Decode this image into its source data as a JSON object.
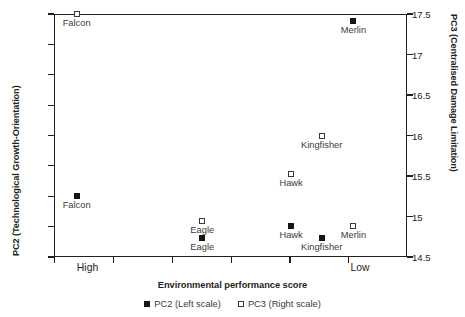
{
  "chart_data": {
    "type": "scatter",
    "title": "",
    "xlabel": "Environmental performance score",
    "ylabel": "PC2 (Technological Growth-Orientation)",
    "y2label": "PC3 (Centralised Damage Limitation)",
    "grid": false,
    "legend_position": "bottom-center",
    "xlim": [
      0,
      6
    ],
    "x_tick_count": 6,
    "x_category_labels": [
      "High",
      "Low"
    ],
    "x_category_positions": [
      0.57,
      5.2
    ],
    "ylim": [
      6.5,
      10.5
    ],
    "y_ticks": [
      "10.5",
      "10.0",
      "9.5",
      "9.0",
      "8.5",
      "8.0",
      "7.5",
      "7.0",
      "6.5"
    ],
    "y_tick_values": [
      10.5,
      10.0,
      9.5,
      9.0,
      8.5,
      8.0,
      7.5,
      7.0,
      6.5
    ],
    "y2lim": [
      14.5,
      17.5
    ],
    "y2_ticks": [
      "17.5",
      "17",
      "16.5",
      "16",
      "15.5",
      "15",
      "14.5"
    ],
    "y2_tick_values": [
      17.5,
      17.0,
      16.5,
      16.0,
      15.5,
      15.0,
      14.5
    ],
    "series": [
      {
        "name": "PC2 (Left scale)",
        "marker": "filled-square",
        "scale": "left",
        "points": [
          {
            "label": "Falcon",
            "x": 0.385,
            "y": 7.51,
            "label_pos": "below"
          },
          {
            "label": "Eagle",
            "x": 2.52,
            "y": 6.82,
            "label_pos": "below"
          },
          {
            "label": "Hawk",
            "x": 4.03,
            "y": 7.01,
            "label_pos": "below"
          },
          {
            "label": "Kingfisher",
            "x": 4.55,
            "y": 6.82,
            "label_pos": "below"
          },
          {
            "label": "Merlin",
            "x": 5.09,
            "y": 10.39,
            "label_pos": "below"
          }
        ]
      },
      {
        "name": "PC3 (Right scale)",
        "marker": "open-square",
        "scale": "right",
        "points": [
          {
            "label": "Falcon",
            "x": 0.385,
            "y": 17.5,
            "label_pos": "below"
          },
          {
            "label": "Eagle",
            "x": 2.52,
            "y": 14.95,
            "label_pos": "below"
          },
          {
            "label": "Hawk",
            "x": 4.03,
            "y": 15.53,
            "label_pos": "below"
          },
          {
            "label": "Kingfisher",
            "x": 4.55,
            "y": 15.99,
            "label_pos": "below"
          },
          {
            "label": "Merlin",
            "x": 5.09,
            "y": 14.88,
            "label_pos": "below"
          }
        ]
      }
    ],
    "legend": [
      {
        "label": "PC2 (Left scale)",
        "marker": "filled-square"
      },
      {
        "label": "PC3 (Right scale)",
        "marker": "open-square"
      }
    ]
  },
  "colors": {
    "axis": "#231f20",
    "marker_filled": "#151515",
    "marker_open_border": "#3a3a3a",
    "label_text": "#3c3a3b",
    "background": "#ffffff"
  }
}
